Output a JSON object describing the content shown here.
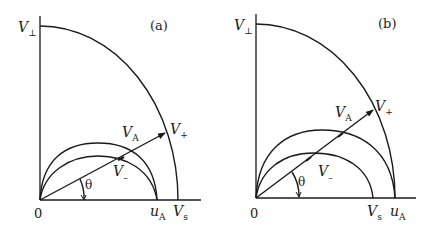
{
  "panels": [
    {
      "id": "a",
      "tag": "(a)",
      "labels": {
        "v_perp": "V",
        "v_perp_sub": "⊥",
        "v_plus": "V",
        "v_plus_sub": "+",
        "v_a": "V",
        "v_a_sub": "A",
        "v_minus": "V",
        "v_minus_sub": "–",
        "theta": "θ",
        "origin": "0",
        "u_a": "u",
        "u_a_sub": "A",
        "v_s": "V",
        "v_s_sub": "s"
      }
    },
    {
      "id": "b",
      "tag": "(b)",
      "labels": {
        "v_perp": "V",
        "v_perp_sub": "⊥",
        "v_plus": "V",
        "v_plus_sub": "+",
        "v_a": "V",
        "v_a_sub": "A",
        "v_minus": "V",
        "v_minus_sub": "–",
        "theta": "θ",
        "origin": "0",
        "v_s": "V",
        "v_s_sub": "s",
        "u_a": "u",
        "u_a_sub": "A"
      }
    }
  ]
}
